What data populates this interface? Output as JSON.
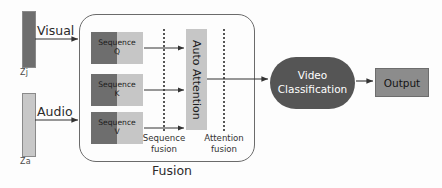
{
  "diagram": {
    "title": "Fusion",
    "inputs": [
      {
        "id": "visual",
        "arrow_label": "Visual",
        "bar_label": "Zj",
        "color": "#6e6e6e"
      },
      {
        "id": "audio",
        "arrow_label": "Audio",
        "bar_label": "Za",
        "color": "#c8c8c8"
      }
    ],
    "fusion": {
      "container_label": "Fusion",
      "sequence_blocks": [
        {
          "id": "q",
          "line1": "Sequence",
          "line2": "Q"
        },
        {
          "id": "k",
          "line1": "Sequence",
          "line2": "K"
        },
        {
          "id": "v",
          "line1": "Sequence",
          "line2": "V"
        }
      ],
      "attention_block": {
        "label": "Auto Attention"
      },
      "dividers": [
        {
          "id": "sequence-fusion",
          "line1": "Sequence",
          "line2": "fusion"
        },
        {
          "id": "attention-fusion",
          "line1": "Attention",
          "line2": "fusion"
        }
      ]
    },
    "classifier": {
      "line1": "Video",
      "line2": "Classification"
    },
    "output": {
      "label": "Output"
    },
    "colors": {
      "dark_gray": "#6e6e6e",
      "light_gray": "#c6c6c6",
      "classifier_fill": "#555555",
      "output_fill": "#8c8c8c",
      "stroke": "#333333"
    }
  }
}
